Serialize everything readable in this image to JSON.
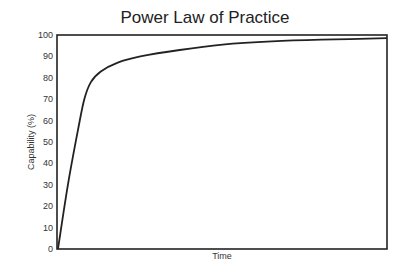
{
  "chart_data": {
    "type": "line",
    "title": "Power Law of Practice",
    "xlabel": "Time",
    "ylabel": "Capability (%)",
    "ylim": [
      0,
      100
    ],
    "yticks": [
      0,
      10,
      20,
      30,
      40,
      50,
      60,
      70,
      80,
      90,
      100
    ],
    "xticks": [],
    "grid": false,
    "legend": null,
    "series": [
      {
        "name": "Capability",
        "x": [
          0,
          0.03,
          0.06,
          0.08,
          0.1,
          0.13,
          0.18,
          0.25,
          0.37,
          0.5,
          0.65,
          0.8,
          1.0
        ],
        "values": [
          0,
          30,
          55,
          70,
          78,
          83,
          87,
          90,
          93,
          95.5,
          97,
          97.8,
          98.5
        ]
      }
    ]
  },
  "labels": {
    "title": "Power Law of Practice",
    "xlabel": "Time",
    "ylabel": "Capability (%)"
  }
}
